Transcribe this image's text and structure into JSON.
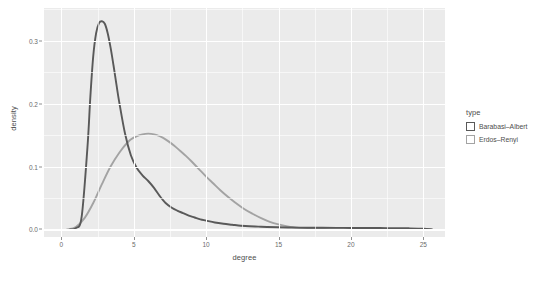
{
  "chart_data": {
    "type": "line",
    "title": "",
    "xlabel": "degree",
    "ylabel": "density",
    "xlim": [
      -1.2,
      26.5
    ],
    "ylim": [
      -0.012,
      0.352
    ],
    "x_ticks": [
      0,
      5,
      10,
      15,
      20,
      25
    ],
    "x_tick_labels": [
      "0",
      "5",
      "10",
      "15",
      "20",
      "25"
    ],
    "y_ticks": [
      0.0,
      0.1,
      0.2,
      0.3
    ],
    "y_tick_labels": [
      "0.0",
      "0.1",
      "0.2",
      "0.3"
    ],
    "grid": true,
    "legend_position": "right",
    "legend_title": "type",
    "panel_background": "#ebebeb",
    "grid_color": "#ffffff",
    "series": [
      {
        "name": "Barabasi–Albert",
        "color": "#595959",
        "x": [
          0.6,
          1.0,
          1.4,
          1.8,
          2.0,
          2.2,
          2.4,
          2.6,
          2.8,
          3.0,
          3.2,
          3.4,
          3.6,
          3.8,
          4.0,
          4.4,
          4.8,
          5.2,
          5.6,
          6.0,
          6.4,
          6.8,
          7.2,
          7.6,
          8.0,
          8.4,
          8.8,
          9.2,
          9.6,
          10.0,
          10.6,
          11.2,
          11.8,
          12.4,
          13.0,
          13.6,
          14.2,
          15.0,
          16.0,
          17.0,
          18.0,
          19.0,
          20.0,
          21.0,
          22.0,
          23.0,
          24.0,
          25.0,
          25.6
        ],
        "y": [
          0.0,
          0.002,
          0.02,
          0.13,
          0.21,
          0.275,
          0.312,
          0.328,
          0.331,
          0.327,
          0.312,
          0.289,
          0.261,
          0.231,
          0.202,
          0.152,
          0.118,
          0.098,
          0.086,
          0.077,
          0.066,
          0.053,
          0.042,
          0.035,
          0.03,
          0.026,
          0.022,
          0.019,
          0.016,
          0.014,
          0.011,
          0.009,
          0.0075,
          0.006,
          0.005,
          0.0045,
          0.004,
          0.0035,
          0.003,
          0.0028,
          0.0026,
          0.0025,
          0.0024,
          0.0023,
          0.0022,
          0.0021,
          0.0018,
          0.0012,
          0.0
        ]
      },
      {
        "name": "Erdos–Renyi",
        "color": "#a3a3a3",
        "x": [
          0.4,
          1.0,
          1.6,
          2.2,
          2.8,
          3.4,
          4.0,
          4.6,
          5.0,
          5.4,
          5.8,
          6.2,
          6.6,
          7.0,
          7.4,
          7.8,
          8.2,
          8.6,
          9.0,
          9.5,
          10.0,
          10.5,
          11.0,
          11.5,
          12.0,
          12.6,
          13.2,
          13.8,
          14.4,
          15.0,
          15.8,
          16.6,
          17.4,
          18.2,
          19.0,
          20.0,
          21.0,
          22.0,
          23.0,
          24.0,
          25.0,
          25.6
        ],
        "y": [
          0.0,
          0.004,
          0.018,
          0.042,
          0.072,
          0.1,
          0.122,
          0.139,
          0.146,
          0.15,
          0.152,
          0.152,
          0.15,
          0.146,
          0.14,
          0.133,
          0.125,
          0.117,
          0.108,
          0.096,
          0.084,
          0.073,
          0.062,
          0.052,
          0.043,
          0.033,
          0.025,
          0.018,
          0.012,
          0.008,
          0.004,
          0.002,
          0.001,
          0.0006,
          0.0004,
          0.0002,
          0.0001,
          0.0001,
          0.0001,
          0.0,
          0.0,
          0.0
        ]
      }
    ],
    "legend_entries": [
      {
        "label": "Barabasi–Albert",
        "color": "#595959"
      },
      {
        "label": "Erdos–Renyi",
        "color": "#a3a3a3"
      }
    ]
  }
}
